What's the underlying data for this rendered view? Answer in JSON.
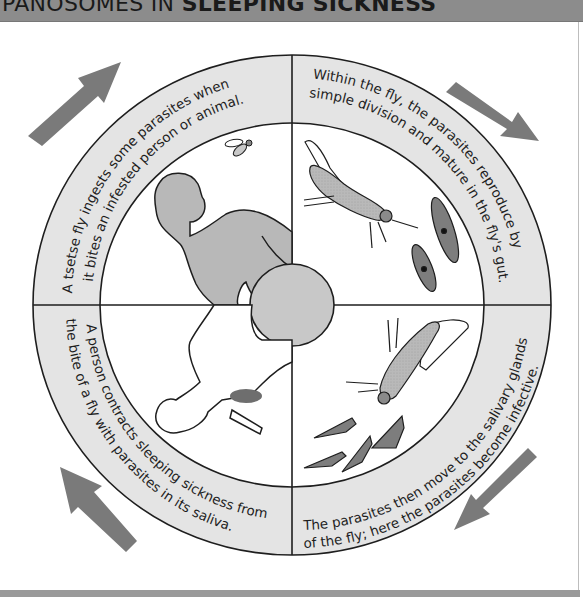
{
  "header": {
    "title_prefix": "PANOSOMES IN ",
    "title_bold": "SLEEPING SICKNESS"
  },
  "diagram": {
    "type": "life-cycle",
    "colors": {
      "header_bg": "#8c8c8c",
      "ring_fill": "#e4e4e4",
      "arrow_fill": "#7a7a7a",
      "figure_fill": "#b8b8b8",
      "parasite_fill": "#7d7d7d",
      "outline": "#1e1e1e"
    },
    "stages": [
      {
        "position": "top-left",
        "line1": "A tsetse fly ingests some parasites when",
        "line2": "it bites an infested person or animal."
      },
      {
        "position": "top-right",
        "line1": "Within the fly, the parasites reproduce by",
        "line2": "simple division and mature in the fly's gut."
      },
      {
        "position": "bottom-right",
        "line1": "The parasites then move to the salivary glands",
        "line2": "of the fly; here the parasites become infective."
      },
      {
        "position": "bottom-left",
        "line1": "A person contracts sleeping sickness from",
        "line2": "the bite of a fly with parasites in its saliva."
      }
    ],
    "arrows": [
      "clockwise-top-left",
      "clockwise-top-right",
      "clockwise-bottom-right",
      "clockwise-bottom-left"
    ],
    "illustrations": [
      "infected-person",
      "tsetse-fly-small",
      "tsetse-fly-gut-parasites",
      "tsetse-fly-salivary-parasites",
      "person-being-bitten"
    ]
  }
}
